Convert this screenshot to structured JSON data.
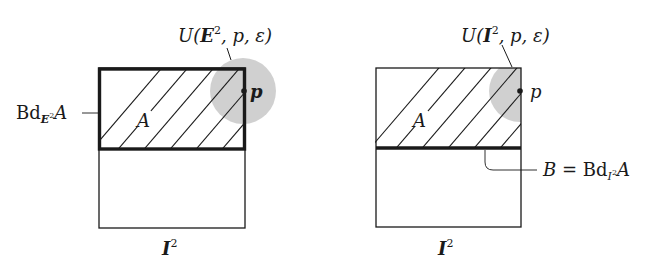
{
  "figure": {
    "left_panel": {
      "neighborhood_label": {
        "prefix": "U(",
        "space": "E",
        "exp": "2",
        "rest": ", p, ε)"
      },
      "boundary_label": {
        "prefix": "Bd",
        "sub_space": "E",
        "sub_exp": "2",
        "set": "A"
      },
      "region_label": "A",
      "point_label": "p",
      "square_label": {
        "space": "I",
        "exp": "2"
      }
    },
    "right_panel": {
      "neighborhood_label": {
        "prefix": "U(",
        "space": "I",
        "exp": "2",
        "rest": ", p, ε)"
      },
      "boundary_label": {
        "lhs": "B",
        "eq": " = ",
        "prefix": "Bd",
        "sub_space": "I",
        "sub_exp": "2",
        "set": "A"
      },
      "region_label": "A",
      "point_label": "p",
      "square_label": {
        "space": "I",
        "exp": "2"
      }
    },
    "colors": {
      "line": "#1a1a1a",
      "neighborhood_fill": "#c8c8c8",
      "background": "#ffffff"
    }
  }
}
